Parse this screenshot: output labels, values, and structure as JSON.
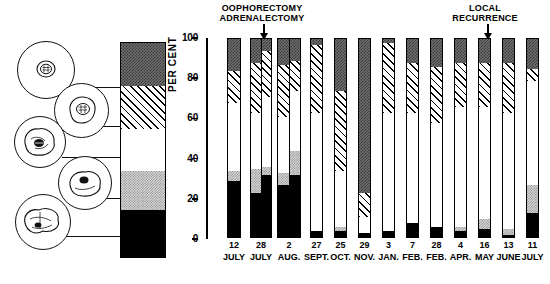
{
  "chart_data": {
    "type": "bar",
    "title": "",
    "xlabel": "",
    "ylabel": "PER CENT",
    "ylim": [
      0,
      100
    ],
    "yticks": [
      0,
      20,
      40,
      60,
      80,
      100
    ],
    "ytick_labels": [
      "0",
      "20",
      "40",
      "60",
      "80",
      "100"
    ],
    "grid": false,
    "legend_position": "left",
    "stacked": true,
    "categories": [
      "12",
      "28",
      "2",
      "27",
      "25",
      "29",
      "3",
      "7",
      "28",
      "4",
      "16",
      "13",
      "11"
    ],
    "category_months": [
      "JULY",
      "JULY",
      "AUG.",
      "SEPT.",
      "OCT.",
      "NOV.",
      "JAN.",
      "FEB.",
      "FEB.",
      "APR.",
      "MAY",
      "JUNE",
      "JULY"
    ],
    "series": [
      {
        "name": "cell-type-1-dark-gray",
        "values": [
          17,
          14,
          13,
          4,
          27,
          78,
          3,
          13,
          15,
          13,
          13,
          13,
          16
        ]
      },
      {
        "name": "cell-type-2-hatched",
        "values": [
          16,
          22,
          24,
          34,
          40,
          12,
          35,
          25,
          28,
          22,
          22,
          25,
          6
        ]
      },
      {
        "name": "cell-type-3-white",
        "values": [
          34,
          29,
          30,
          59,
          28,
          8,
          59,
          55,
          52,
          60,
          56,
          58,
          52
        ]
      },
      {
        "name": "cell-type-4-light-gray",
        "values": [
          5,
          4,
          4,
          0,
          2,
          0,
          0,
          0,
          0,
          2,
          5,
          3,
          14
        ]
      },
      {
        "name": "cell-type-5-black",
        "values": [
          28,
          31,
          29,
          3,
          3,
          2,
          3,
          7,
          5,
          3,
          4,
          1,
          12
        ]
      }
    ],
    "annotations": [
      {
        "name": "oophorectomy-adrenalectomy",
        "lines": [
          "OOPHORECTOMY",
          "ADRENALECTOMY"
        ],
        "points_to_category": "2"
      },
      {
        "name": "local-recurrence",
        "lines": [
          "LOCAL",
          "RECURRENCE"
        ],
        "points_to_category": "13"
      }
    ]
  },
  "legend": {
    "name": "cell-morphology-legend",
    "swatches": [
      {
        "name": "dark-gray-swatch",
        "pattern": "dark",
        "cell": "round-cell-large-nucleus"
      },
      {
        "name": "hatched-swatch",
        "pattern": "hatch",
        "cell": "round-cell-irregular-nucleus"
      },
      {
        "name": "white-swatch",
        "pattern": "white",
        "cell": "irregular-cell-dense-nucleus"
      },
      {
        "name": "light-gray-swatch",
        "pattern": "light",
        "cell": "irregular-cell-small-dark-nucleus"
      },
      {
        "name": "black-swatch",
        "pattern": "black",
        "cell": "amoeboid-cell-pyknotic-nucleus"
      }
    ]
  },
  "axis": {
    "y_title": "PER CENT"
  },
  "bars": [
    {
      "label": "12",
      "month": "JULY",
      "x": 20,
      "w": 14,
      "wide": false,
      "segments": [
        {
          "p": "black",
          "from": 0,
          "to": 28
        },
        {
          "p": "light",
          "from": 28,
          "to": 33
        },
        {
          "p": "white",
          "from": 33,
          "to": 67
        },
        {
          "p": "hatch",
          "from": 67,
          "to": 83
        },
        {
          "p": "dark",
          "from": 83,
          "to": 100
        }
      ]
    },
    {
      "label": "28",
      "month": "JULY",
      "x": 43,
      "w": 22,
      "wide": true,
      "segments": [
        {
          "p": "black",
          "from": 0,
          "to": 22
        },
        {
          "p": "light",
          "from": 22,
          "to": 34
        },
        {
          "p": "white",
          "from": 34,
          "to": 62
        },
        {
          "p": "hatch",
          "from": 62,
          "to": 87
        },
        {
          "p": "dark",
          "from": 87,
          "to": 100
        }
      ],
      "segments_right": [
        {
          "p": "black",
          "from": 0,
          "to": 31
        },
        {
          "p": "light",
          "from": 31,
          "to": 35
        },
        {
          "p": "white",
          "from": 35,
          "to": 70
        },
        {
          "p": "hatch",
          "from": 70,
          "to": 93
        },
        {
          "p": "dark",
          "from": 93,
          "to": 100
        }
      ]
    },
    {
      "label": "2",
      "month": "AUG.",
      "x": 70,
      "w": 24,
      "wide": true,
      "segments": [
        {
          "p": "black",
          "from": 0,
          "to": 26
        },
        {
          "p": "light",
          "from": 26,
          "to": 32
        },
        {
          "p": "white",
          "from": 32,
          "to": 60
        },
        {
          "p": "hatch",
          "from": 60,
          "to": 86
        },
        {
          "p": "dark",
          "from": 86,
          "to": 100
        }
      ],
      "segments_right": [
        {
          "p": "black",
          "from": 0,
          "to": 31
        },
        {
          "p": "light",
          "from": 31,
          "to": 43
        },
        {
          "p": "white",
          "from": 43,
          "to": 73
        },
        {
          "p": "hatch",
          "from": 73,
          "to": 88
        },
        {
          "p": "dark",
          "from": 88,
          "to": 100
        }
      ]
    },
    {
      "label": "27",
      "month": "SEPT.",
      "x": 103,
      "w": 13,
      "wide": false,
      "segments": [
        {
          "p": "black",
          "from": 0,
          "to": 3
        },
        {
          "p": "white",
          "from": 3,
          "to": 62
        },
        {
          "p": "hatch",
          "from": 62,
          "to": 96
        },
        {
          "p": "dark",
          "from": 96,
          "to": 100
        }
      ]
    },
    {
      "label": "25",
      "month": "OCT.",
      "x": 127,
      "w": 13,
      "wide": false,
      "segments": [
        {
          "p": "black",
          "from": 0,
          "to": 3
        },
        {
          "p": "light",
          "from": 3,
          "to": 5
        },
        {
          "p": "white",
          "from": 5,
          "to": 33
        },
        {
          "p": "hatch",
          "from": 33,
          "to": 73
        },
        {
          "p": "dark",
          "from": 73,
          "to": 100
        }
      ]
    },
    {
      "label": "29",
      "month": "NOV.",
      "x": 151,
      "w": 13,
      "wide": false,
      "segments": [
        {
          "p": "black",
          "from": 0,
          "to": 2
        },
        {
          "p": "white",
          "from": 2,
          "to": 10
        },
        {
          "p": "hatch",
          "from": 10,
          "to": 22
        },
        {
          "p": "dark",
          "from": 22,
          "to": 100
        }
      ]
    },
    {
      "label": "3",
      "month": "JAN.",
      "x": 175,
      "w": 13,
      "wide": false,
      "segments": [
        {
          "p": "black",
          "from": 0,
          "to": 3
        },
        {
          "p": "white",
          "from": 3,
          "to": 62
        },
        {
          "p": "hatch",
          "from": 62,
          "to": 97
        },
        {
          "p": "dark",
          "from": 97,
          "to": 100
        }
      ]
    },
    {
      "label": "7",
      "month": "FEB.",
      "x": 199,
      "w": 13,
      "wide": false,
      "segments": [
        {
          "p": "black",
          "from": 0,
          "to": 7
        },
        {
          "p": "white",
          "from": 7,
          "to": 62
        },
        {
          "p": "hatch",
          "from": 62,
          "to": 87
        },
        {
          "p": "dark",
          "from": 87,
          "to": 100
        }
      ]
    },
    {
      "label": "28",
      "month": "FEB.",
      "x": 223,
      "w": 13,
      "wide": false,
      "segments": [
        {
          "p": "black",
          "from": 0,
          "to": 5
        },
        {
          "p": "white",
          "from": 5,
          "to": 57
        },
        {
          "p": "hatch",
          "from": 57,
          "to": 85
        },
        {
          "p": "dark",
          "from": 85,
          "to": 100
        }
      ]
    },
    {
      "label": "4",
      "month": "APR.",
      "x": 247,
      "w": 13,
      "wide": false,
      "segments": [
        {
          "p": "black",
          "from": 0,
          "to": 3
        },
        {
          "p": "light",
          "from": 3,
          "to": 5
        },
        {
          "p": "white",
          "from": 5,
          "to": 65
        },
        {
          "p": "hatch",
          "from": 65,
          "to": 87
        },
        {
          "p": "dark",
          "from": 87,
          "to": 100
        }
      ]
    },
    {
      "label": "16",
      "month": "MAY",
      "x": 271,
      "w": 13,
      "wide": false,
      "segments": [
        {
          "p": "black",
          "from": 0,
          "to": 4
        },
        {
          "p": "light",
          "from": 4,
          "to": 9
        },
        {
          "p": "white",
          "from": 9,
          "to": 65
        },
        {
          "p": "hatch",
          "from": 65,
          "to": 87
        },
        {
          "p": "dark",
          "from": 87,
          "to": 100
        }
      ]
    },
    {
      "label": "13",
      "month": "JUNE",
      "x": 295,
      "w": 13,
      "wide": false,
      "segments": [
        {
          "p": "black",
          "from": 0,
          "to": 1
        },
        {
          "p": "light",
          "from": 1,
          "to": 4
        },
        {
          "p": "white",
          "from": 4,
          "to": 62
        },
        {
          "p": "hatch",
          "from": 62,
          "to": 87
        },
        {
          "p": "dark",
          "from": 87,
          "to": 100
        }
      ]
    },
    {
      "label": "11",
      "month": "JULY",
      "x": 319,
      "w": 13,
      "wide": false,
      "segments": [
        {
          "p": "black",
          "from": 0,
          "to": 12
        },
        {
          "p": "light",
          "from": 12,
          "to": 26
        },
        {
          "p": "white",
          "from": 26,
          "to": 78
        },
        {
          "p": "hatch",
          "from": 78,
          "to": 84
        },
        {
          "p": "dark",
          "from": 84,
          "to": 100
        }
      ]
    }
  ],
  "annotation_left": {
    "line1": "OOPHORECTOMY",
    "line2": "ADRENALECTOMY"
  },
  "annotation_right": {
    "line1": "LOCAL",
    "line2": "RECURRENCE"
  }
}
